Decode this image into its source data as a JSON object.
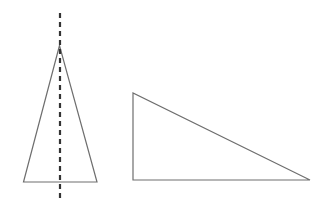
{
  "canvas": {
    "width": 320,
    "height": 209,
    "background_color": "#ffffff",
    "title": "Two triangles with line of symmetry"
  },
  "style": {
    "outline_color": "#6e6e6e",
    "outline_width": 1.2,
    "symmetry_line_color": "#333333",
    "symmetry_line_width": 2.2,
    "symmetry_dash_pattern": "5,4"
  },
  "shapes": [
    {
      "id": "isosceles-triangle",
      "name": "Isosceles triangle",
      "type": "triangle",
      "subtype": "isosceles",
      "points": "59.5,45.5 23.5,182 97,182",
      "vertices": [
        {
          "label": "apex",
          "x": 59.5,
          "y": 45.5
        },
        {
          "label": "base-left",
          "x": 23.5,
          "y": 182
        },
        {
          "label": "base-right",
          "x": 97,
          "y": 182
        }
      ],
      "stroke": "#6e6e6e",
      "fill": "none"
    },
    {
      "id": "right-triangle",
      "name": "Right triangle",
      "type": "triangle",
      "subtype": "right",
      "points": "133,93 133,180 310,180",
      "vertices": [
        {
          "label": "top-left",
          "x": 133,
          "y": 93
        },
        {
          "label": "bottom-left-right-angle",
          "x": 133,
          "y": 180
        },
        {
          "label": "bottom-right",
          "x": 310,
          "y": 180
        }
      ],
      "stroke": "#6e6e6e",
      "fill": "none"
    }
  ],
  "annotations": [
    {
      "id": "symmetry-axis",
      "name": "Vertical line of symmetry",
      "type": "dashed-line",
      "orientation": "vertical",
      "x1": 60,
      "y1": 13,
      "x2": 60,
      "y2": 199,
      "stroke": "#333333",
      "dash": "5,4"
    }
  ]
}
